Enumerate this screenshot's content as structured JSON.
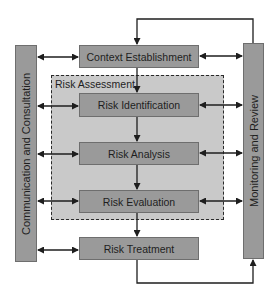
{
  "diagram": {
    "side_panels": {
      "left": {
        "label": "Communication and Consultation"
      },
      "right": {
        "label": "Monitoring and Review"
      }
    },
    "group": {
      "label": "Risk Assessment"
    },
    "steps": [
      {
        "id": "context",
        "label": "Context Establishment"
      },
      {
        "id": "identification",
        "label": "Risk Identification"
      },
      {
        "id": "analysis",
        "label": "Risk Analysis"
      },
      {
        "id": "evaluation",
        "label": "Risk Evaluation"
      },
      {
        "id": "treatment",
        "label": "Risk Treatment"
      }
    ],
    "connections": [
      {
        "from": "context",
        "to": "identification",
        "type": "one-way"
      },
      {
        "from": "identification",
        "to": "analysis",
        "type": "one-way"
      },
      {
        "from": "analysis",
        "to": "evaluation",
        "type": "one-way"
      },
      {
        "from": "evaluation",
        "to": "treatment",
        "type": "one-way"
      },
      {
        "from": "treatment",
        "to": "Monitoring and Review",
        "type": "one-way"
      },
      {
        "from": "Monitoring and Review",
        "to": "context",
        "type": "one-way"
      },
      {
        "from": "Communication and Consultation",
        "to": "each step",
        "type": "two-way"
      },
      {
        "from": "each step",
        "to": "Monitoring and Review",
        "type": "two-way"
      }
    ],
    "colors": {
      "box_fill": "#9a9a9a",
      "group_fill": "#c9c9c9",
      "line": "#1e1e1e"
    }
  }
}
